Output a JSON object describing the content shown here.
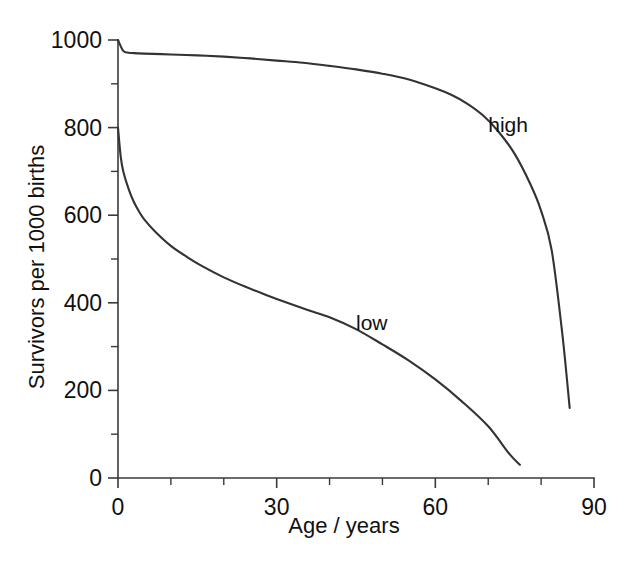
{
  "chart_data": {
    "type": "line",
    "title": "",
    "xlabel": "Age / years",
    "ylabel": "Survivors per 1000 births",
    "xlim": [
      0,
      90
    ],
    "ylim": [
      0,
      1000
    ],
    "x_major_ticks": [
      0,
      30,
      60,
      90
    ],
    "x_minor_ticks": [
      10,
      20,
      40,
      50,
      70,
      80
    ],
    "y_major_ticks": [
      0,
      200,
      400,
      600,
      800,
      1000
    ],
    "y_minor_ticks": [
      100,
      300,
      500,
      700,
      900
    ],
    "x_tick_labels": [
      "0",
      "30",
      "60",
      "90"
    ],
    "y_tick_labels": [
      "0",
      "200",
      "400",
      "600",
      "800",
      "1000"
    ],
    "grid": false,
    "legend": "inline-labels",
    "series": [
      {
        "name": "high",
        "label": "high",
        "label_x": 70,
        "label_y": 805,
        "x": [
          0,
          1,
          2,
          3,
          5,
          10,
          15,
          20,
          25,
          30,
          35,
          40,
          45,
          50,
          55,
          60,
          63,
          66,
          69,
          72,
          75,
          78,
          80,
          82,
          84,
          85.4
        ],
        "y": [
          1000,
          975,
          971,
          970,
          969,
          967,
          965,
          962,
          958,
          953,
          948,
          941,
          933,
          923,
          910,
          890,
          875,
          855,
          828,
          790,
          740,
          670,
          610,
          520,
          330,
          160
        ]
      },
      {
        "name": "low",
        "label": "low",
        "label_x": 45,
        "label_y": 355,
        "x": [
          0,
          0.5,
          1,
          2,
          3,
          4,
          5,
          7,
          10,
          13,
          16,
          20,
          24,
          28,
          32,
          36,
          40,
          45,
          50,
          55,
          60,
          65,
          70,
          74,
          76
        ],
        "y": [
          800,
          735,
          700,
          660,
          630,
          608,
          590,
          563,
          530,
          505,
          483,
          458,
          437,
          418,
          400,
          383,
          367,
          340,
          305,
          268,
          225,
          175,
          118,
          55,
          30
        ]
      }
    ]
  },
  "axis": {
    "x_label": "Age / years",
    "y_label": "Survivors per 1000 births"
  }
}
